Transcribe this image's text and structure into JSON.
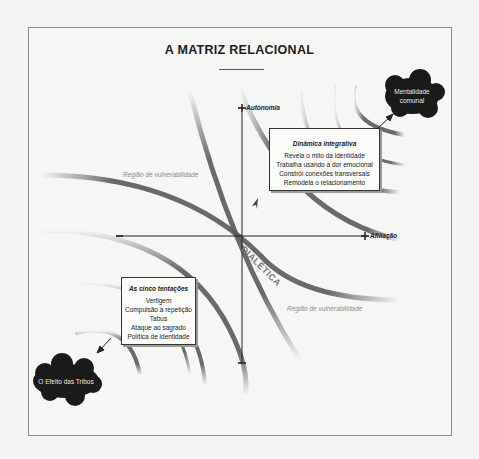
{
  "title": "A MATRIZ RELACIONAL",
  "axes": {
    "vertical_positive": "Autonomia",
    "horizontal_positive": "Afiliação",
    "plus_symbol": "+",
    "minus_symbol": "−"
  },
  "center_label": "DIALÉTICA",
  "regions": {
    "upper_left": "Região de vulnerabilidade",
    "lower_right": "Região de vulnerabilidade"
  },
  "integrative_box": {
    "title": "Dinâmica integrativa",
    "items": [
      "Revela o mito da identidade",
      "Trabalha usando a dor emocional",
      "Constrói conexões transversais",
      "Remodela o relacionamento"
    ]
  },
  "temptations_box": {
    "title": "As cinco tentações",
    "items": [
      "Vertigem",
      "Compulsão à repetição",
      "Tabus",
      "Ataque ao sagrado",
      "Política de identidade"
    ]
  },
  "clouds": {
    "top_right": [
      "Mentalidade",
      "comunal"
    ],
    "bottom_left": "O Efeito das Tribos"
  },
  "colors": {
    "background": "#f3f3f2",
    "arc": "#5a5a5a",
    "cloud": "#1a1a1a",
    "axis": "#222222"
  }
}
